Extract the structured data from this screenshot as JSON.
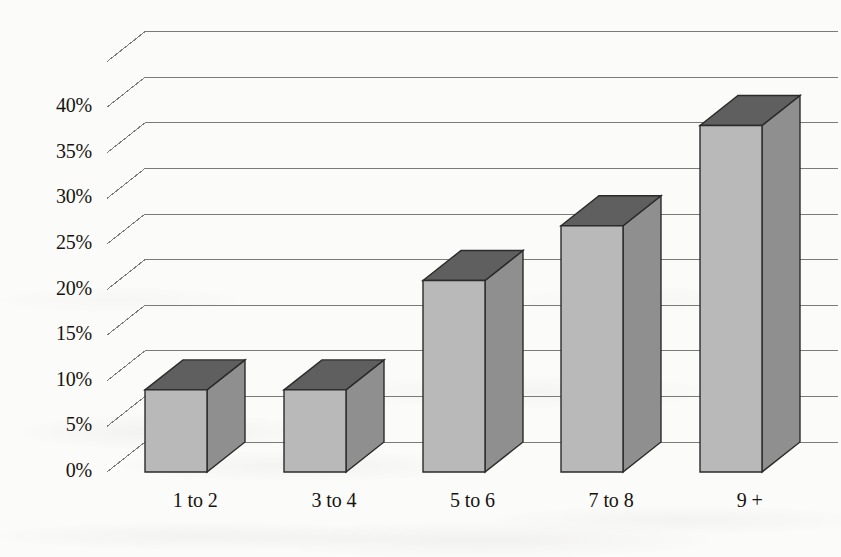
{
  "figure": {
    "background_color": "#fbfbf9",
    "bar_face_color": "#b9b9b9",
    "bar_top_color": "#5f5f5f",
    "bar_side_color": "#8f8f8f",
    "bar_edge_color": "#2b2b2b",
    "gridline_color": "#7a7a7a",
    "text_color": "#16130f"
  },
  "chart_data": {
    "type": "bar",
    "title": "",
    "subtitle": "",
    "xlabel": "",
    "ylabel": "",
    "categories": [
      "1 to 2",
      "3 to 4",
      "5 to 6",
      "7 to 8",
      "9 +"
    ],
    "values": [
      9,
      9,
      21,
      27,
      38
    ],
    "value_labels": [
      "9%",
      "9%",
      "21%",
      "27%",
      "38%"
    ],
    "ylim": [
      0,
      45
    ],
    "ytick_values": [
      0,
      5,
      10,
      15,
      20,
      25,
      30,
      35,
      40
    ],
    "ytick_labels": [
      "0%",
      "5%",
      "10%",
      "15%",
      "20%",
      "25%",
      "30%",
      "35%",
      "40%"
    ],
    "grid": true,
    "grid_axis": "y",
    "legend": false,
    "legend_position": "none",
    "style": "3d-column",
    "series": [
      {
        "name": "Percent",
        "values": [
          9,
          9,
          21,
          27,
          38
        ]
      }
    ]
  },
  "axis": {
    "y_labels": [
      "40%",
      "35%",
      "30%",
      "25%",
      "20%",
      "15%",
      "10%",
      "5%",
      "0%"
    ],
    "x_labels": [
      "1 to 2",
      "3 to 4",
      "5 to 6",
      "7 to 8",
      "9 +"
    ]
  }
}
